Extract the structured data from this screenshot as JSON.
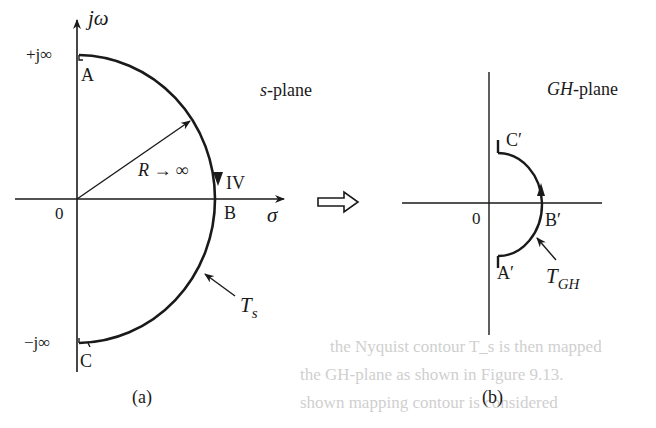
{
  "figure": {
    "panel_a": {
      "plane_label": {
        "italic": "s",
        "rest": "-plane"
      },
      "axis_vertical_label": "jω",
      "axis_horizontal_label": "σ",
      "origin_label": "0",
      "top_label": "+j∞",
      "bottom_label": "−j∞",
      "point_A": "A",
      "point_B": "B",
      "point_C": "C",
      "radius_label": "R → ∞",
      "quadrant_label": "IV",
      "contour_label": {
        "main": "T",
        "sub": "s"
      },
      "caption": "(a)"
    },
    "transform_arrow": "maps-to-arrow",
    "panel_b": {
      "plane_label": {
        "italic": "GH",
        "rest": "-plane"
      },
      "origin_label": "0",
      "point_A": "A′",
      "point_B": "B′",
      "point_C": "C′",
      "contour_label": {
        "main": "T",
        "sub": "GH"
      },
      "caption": "(b)"
    },
    "bleed_through_text": [
      "the Nyquist contour T_s is then mapped",
      "the GH-plane as shown in Figure 9.13.",
      "shown mapping contour is considered"
    ],
    "colors": {
      "ink": "#1a1a1a",
      "paper": "#ffffff",
      "bleed": "#cfcfcf"
    }
  }
}
